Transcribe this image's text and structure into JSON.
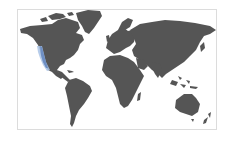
{
  "map": {
    "type": "world-choropleth",
    "projection": "miller-like",
    "land_color": "#555555",
    "background_color": "#ffffff",
    "border_color": "#dcdcdc",
    "highlight": {
      "region": "US West Coast",
      "color": "#6e8fc4",
      "glow_color": "#a9c3e6"
    },
    "regions": [
      {
        "name": "North America"
      },
      {
        "name": "Greenland"
      },
      {
        "name": "South America"
      },
      {
        "name": "Europe"
      },
      {
        "name": "Africa"
      },
      {
        "name": "Asia"
      },
      {
        "name": "Australia"
      },
      {
        "name": "New Zealand"
      }
    ]
  }
}
